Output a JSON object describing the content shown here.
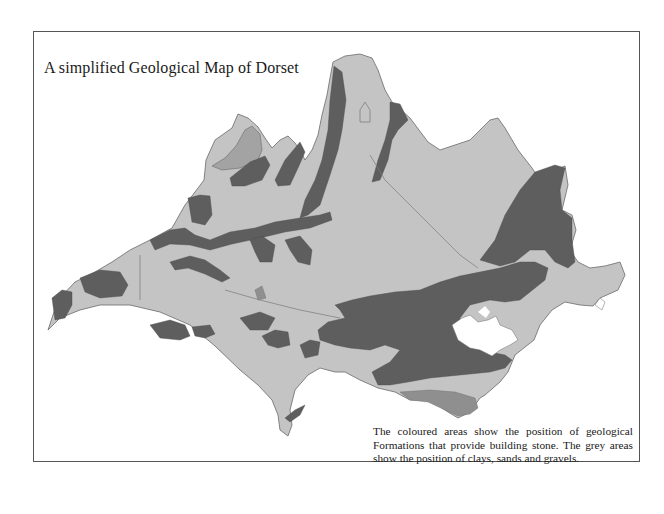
{
  "figure": {
    "title": "A simplified Geological Map of Dorset",
    "caption": "The coloured areas show the position of geological Formations that provide building stone. The grey areas show the position of clays, sands and gravels."
  },
  "map": {
    "region": "Dorset",
    "legend_colors": {
      "clays_sands_gravels": "#c4c4c4",
      "building_stone_dark": "#5e5e5e",
      "building_stone_mid": "#8f8f8f",
      "urban_white": "#ffffff",
      "outline": "#6a6a6a"
    }
  }
}
